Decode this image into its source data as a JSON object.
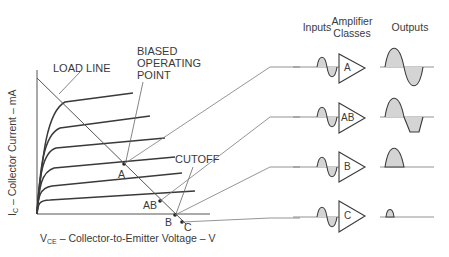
{
  "diagram": {
    "annotations": {
      "load_line": "LOAD LINE",
      "biased_operating_point": [
        "BIASED",
        "OPERATING",
        "POINT"
      ],
      "cutoff": "CUTOFF"
    },
    "axes": {
      "y_label_main": "I",
      "y_label_sub": "C",
      "y_label_rest": " – Collector Current – mA",
      "x_label_main": "V",
      "x_label_sub": "CE",
      "x_label_rest": " – Collector-to-Emitter Voltage – V"
    },
    "operating_points": [
      {
        "label": "A"
      },
      {
        "label": "AB"
      },
      {
        "label": "B"
      },
      {
        "label": "C"
      }
    ],
    "columns": {
      "inputs": "Inputs",
      "classes_line1": "Amplifier",
      "classes_line2": "Classes",
      "outputs": "Outputs"
    },
    "amplifier_classes": [
      {
        "class": "A",
        "output": "full sine wave"
      },
      {
        "class": "AB",
        "output": "sine slightly clipped"
      },
      {
        "class": "B",
        "output": "positive half-wave"
      },
      {
        "class": "C",
        "output": "small pulse"
      }
    ],
    "colors": {
      "line": "#3a3a3a",
      "fill": "#d4d4d4",
      "leader": "#7a7a7a"
    }
  }
}
